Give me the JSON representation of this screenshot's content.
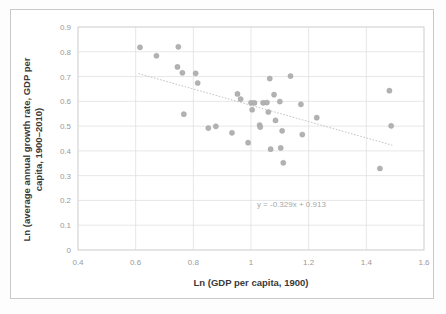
{
  "figure": {
    "background_color": "#ffffff",
    "frame_color": "#c9c9c9",
    "marker_color": "#b2b2b2",
    "grid_color": "#dcdcdc",
    "trendline_color": "#c4c4c4"
  },
  "chart_data": {
    "type": "scatter",
    "title": "",
    "subtitle": "",
    "xlabel": "Ln (GDP per capita, 1900)",
    "ylabel": "Ln (average annual growth rate, GDP per capita, 1900–2010)",
    "xlim": [
      0.4,
      1.6
    ],
    "ylim": [
      0,
      0.9
    ],
    "xticks": [
      "0.4",
      "0.6",
      "0.8",
      "1",
      "1.2",
      "1.4",
      "1.6"
    ],
    "xtick_values": [
      0.4,
      0.6,
      0.8,
      1.0,
      1.2,
      1.4,
      1.6
    ],
    "yticks": [
      "0",
      "0.1",
      "0.2",
      "0.3",
      "0.4",
      "0.5",
      "0.6",
      "0.7",
      "0.8",
      "0.9"
    ],
    "ytick_values": [
      0,
      0.1,
      0.2,
      0.3,
      0.4,
      0.5,
      0.6,
      0.7,
      0.8,
      0.9
    ],
    "grid": true,
    "grid_axis": "both",
    "legend": false,
    "legend_position": "none",
    "annotations": [
      {
        "name": "trendline-equation",
        "text": "y = -0.329x + 0.913",
        "x": 1.14,
        "y": 0.175
      }
    ],
    "trendline": {
      "type": "linear",
      "slope": -0.329,
      "intercept": 0.913,
      "equation": "y = -0.329x + 0.913",
      "style": "dotted",
      "x_start": 0.61,
      "x_end": 1.49
    },
    "series": [
      {
        "name": "countries",
        "marker": "circle",
        "color": "#b2b2b2",
        "points": [
          {
            "x": 0.615,
            "y": 0.818
          },
          {
            "x": 0.672,
            "y": 0.784
          },
          {
            "x": 0.748,
            "y": 0.82
          },
          {
            "x": 0.745,
            "y": 0.739
          },
          {
            "x": 0.762,
            "y": 0.715
          },
          {
            "x": 0.767,
            "y": 0.548
          },
          {
            "x": 0.808,
            "y": 0.713
          },
          {
            "x": 0.815,
            "y": 0.674
          },
          {
            "x": 0.852,
            "y": 0.492
          },
          {
            "x": 0.878,
            "y": 0.499
          },
          {
            "x": 0.934,
            "y": 0.473
          },
          {
            "x": 0.953,
            "y": 0.63
          },
          {
            "x": 0.964,
            "y": 0.609
          },
          {
            "x": 0.99,
            "y": 0.433
          },
          {
            "x": 1.0,
            "y": 0.594
          },
          {
            "x": 1.004,
            "y": 0.566
          },
          {
            "x": 1.012,
            "y": 0.594
          },
          {
            "x": 1.03,
            "y": 0.504
          },
          {
            "x": 1.032,
            "y": 0.496
          },
          {
            "x": 1.042,
            "y": 0.594
          },
          {
            "x": 1.055,
            "y": 0.595
          },
          {
            "x": 1.06,
            "y": 0.557
          },
          {
            "x": 1.065,
            "y": 0.692
          },
          {
            "x": 1.068,
            "y": 0.407
          },
          {
            "x": 1.08,
            "y": 0.627
          },
          {
            "x": 1.085,
            "y": 0.523
          },
          {
            "x": 1.1,
            "y": 0.599
          },
          {
            "x": 1.103,
            "y": 0.412
          },
          {
            "x": 1.108,
            "y": 0.481
          },
          {
            "x": 1.112,
            "y": 0.352
          },
          {
            "x": 1.137,
            "y": 0.702
          },
          {
            "x": 1.173,
            "y": 0.588
          },
          {
            "x": 1.178,
            "y": 0.466
          },
          {
            "x": 1.228,
            "y": 0.534
          },
          {
            "x": 1.447,
            "y": 0.329
          },
          {
            "x": 1.48,
            "y": 0.643
          },
          {
            "x": 1.486,
            "y": 0.501
          }
        ]
      }
    ]
  }
}
